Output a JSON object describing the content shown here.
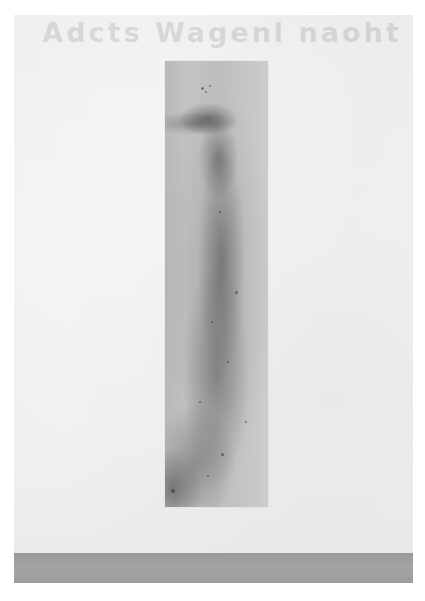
{
  "scene": {
    "description": "Photograph of a tall vertical abstract ink/wash artwork hung on a white gallery wall above a gray floor",
    "bleed_through_text": "Adcts Wagenl naoht",
    "colors": {
      "page_background": "#ffffff",
      "wall": "#efefef",
      "artwork_base": "#c0c0c0",
      "artwork_dark_marks": "#4a4a4a",
      "floor": "#9e9e9e"
    }
  },
  "artwork": {
    "orientation": "vertical",
    "dominant_feature": "dark diagonal smudge near top with vertical speckled streak running down the center"
  }
}
